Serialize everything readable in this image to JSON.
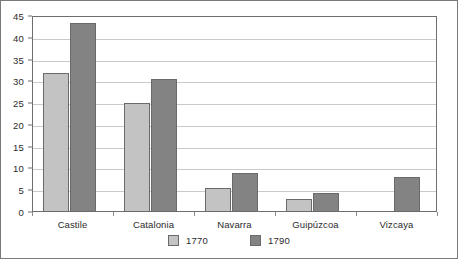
{
  "chart_data": {
    "type": "bar",
    "title": "",
    "subtitle": "",
    "xlabel": "",
    "ylabel": "",
    "categories": [
      "Castile",
      "Catalonia",
      "Navarra",
      "Guipúzcoa",
      "Vizcaya"
    ],
    "series": [
      {
        "name": "1770",
        "color": "#c3c3c3",
        "values": [
          32,
          25,
          5.5,
          3,
          null
        ]
      },
      {
        "name": "1790",
        "color": "#838383",
        "values": [
          43.5,
          30.5,
          9,
          4.3,
          8
        ]
      }
    ],
    "ylim": [
      0,
      45
    ],
    "ytick_step": 5,
    "yticks": [
      45,
      40,
      35,
      30,
      25,
      20,
      15,
      10,
      5,
      0
    ],
    "ytick_labels": [
      "45",
      "40",
      "35",
      "30",
      "25",
      "20",
      "15",
      "10",
      "5",
      "0"
    ],
    "grid": true,
    "grid_axis": "y",
    "legend": [
      "1770",
      "1790"
    ],
    "legend_position": "bottom",
    "frame": true
  }
}
